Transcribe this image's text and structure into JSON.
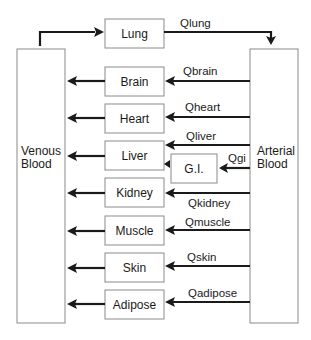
{
  "diagram": {
    "colors": {
      "line": "#1a1a1a",
      "box_border": "#8a8a8a",
      "background": "#ffffff"
    },
    "pools": {
      "venous": {
        "line1": "Venous",
        "line2": "Blood"
      },
      "arterial": {
        "line1": "Arterial",
        "line2": "Blood"
      }
    },
    "lung": {
      "label": "Lung",
      "flow": "Qlung"
    },
    "organs": [
      {
        "label": "Brain",
        "flow": "Qbrain"
      },
      {
        "label": "Heart",
        "flow": "Qheart"
      },
      {
        "label": "Liver",
        "flow": "Qliver"
      },
      {
        "label": "Kidney",
        "flow": "Qkidney"
      },
      {
        "label": "Muscle",
        "flow": "Qmuscle"
      },
      {
        "label": "Skin",
        "flow": "Qskin"
      },
      {
        "label": "Adipose",
        "flow": "Qadipose"
      }
    ],
    "gi": {
      "label": "G.I.",
      "flow": "Qgi"
    }
  }
}
